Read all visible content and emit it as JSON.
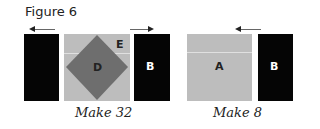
{
  "figure": {
    "title": "Figure 6"
  },
  "left_unit": {
    "left_strip_label": "",
    "center_label": "D",
    "corner_label": "E",
    "right_strip_label": "B",
    "caption": "Make 32",
    "arrows": [
      "left",
      "right"
    ]
  },
  "right_unit": {
    "center_label": "A",
    "right_strip_label": "B",
    "caption": "Make 8",
    "arrows": [
      "left"
    ]
  },
  "colors": {
    "dark": "#050505",
    "light_gray": "#bdbdbd",
    "diamond": "#6e6e6e",
    "label_dark": "#222222",
    "label_light": "#ffffff"
  }
}
